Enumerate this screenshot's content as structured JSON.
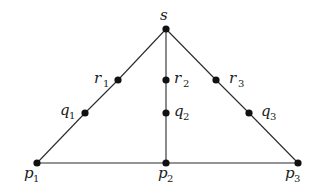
{
  "diagram": {
    "type": "graph",
    "nodes": [
      {
        "id": "s",
        "name": "s",
        "sub": "",
        "x": 166,
        "y": 29,
        "label_x": 160,
        "label_y": 20,
        "sub_x": 0,
        "sub_y": 0
      },
      {
        "id": "r1",
        "name": "r",
        "sub": "1",
        "x": 118,
        "y": 80,
        "label_x": 94,
        "label_y": 83,
        "sub_x": 103,
        "sub_y": 87
      },
      {
        "id": "q1",
        "name": "q",
        "sub": "1",
        "x": 85,
        "y": 113,
        "label_x": 60,
        "label_y": 115,
        "sub_x": 69,
        "sub_y": 119
      },
      {
        "id": "r2",
        "name": "r",
        "sub": "2",
        "x": 166,
        "y": 80,
        "label_x": 174,
        "label_y": 83,
        "sub_x": 183,
        "sub_y": 87
      },
      {
        "id": "q2",
        "name": "q",
        "sub": "2",
        "x": 166,
        "y": 113,
        "label_x": 174,
        "label_y": 116,
        "sub_x": 183,
        "sub_y": 120
      },
      {
        "id": "r3",
        "name": "r",
        "sub": "3",
        "x": 216,
        "y": 80,
        "label_x": 229,
        "label_y": 83,
        "sub_x": 238,
        "sub_y": 87
      },
      {
        "id": "q3",
        "name": "q",
        "sub": "3",
        "x": 249,
        "y": 113,
        "label_x": 261,
        "label_y": 116,
        "sub_x": 270,
        "sub_y": 120
      },
      {
        "id": "p1",
        "name": "p",
        "sub": "1",
        "x": 37,
        "y": 163,
        "label_x": 24,
        "label_y": 178,
        "sub_x": 33,
        "sub_y": 182
      },
      {
        "id": "p2",
        "name": "p",
        "sub": "2",
        "x": 166,
        "y": 163,
        "label_x": 158,
        "label_y": 178,
        "sub_x": 167,
        "sub_y": 182
      },
      {
        "id": "p3",
        "name": "p",
        "sub": "3",
        "x": 298,
        "y": 163,
        "label_x": 285,
        "label_y": 178,
        "sub_x": 294,
        "sub_y": 182
      }
    ],
    "edges": [
      {
        "from": "s",
        "to": "r1"
      },
      {
        "from": "r1",
        "to": "q1"
      },
      {
        "from": "q1",
        "to": "p1"
      },
      {
        "from": "s",
        "to": "r2"
      },
      {
        "from": "r2",
        "to": "q2"
      },
      {
        "from": "q2",
        "to": "p2"
      },
      {
        "from": "s",
        "to": "r3"
      },
      {
        "from": "r3",
        "to": "q3"
      },
      {
        "from": "q3",
        "to": "p3"
      },
      {
        "from": "p1",
        "to": "p2"
      },
      {
        "from": "p2",
        "to": "p3"
      }
    ],
    "colors": {
      "edge": "#2a2a2a",
      "node": "#111111",
      "label": "#1a1a1a",
      "background": "#ffffff"
    }
  }
}
